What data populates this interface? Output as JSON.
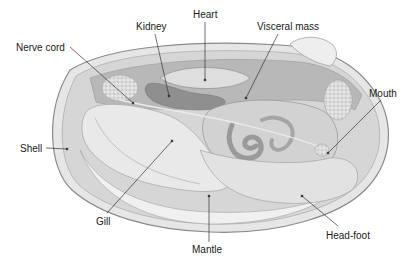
{
  "diagram": {
    "labels": [
      {
        "id": "heart",
        "text": "Heart",
        "x": 193,
        "y": 9
      },
      {
        "id": "kidney",
        "text": "Kidney",
        "x": 136,
        "y": 21
      },
      {
        "id": "visceral-mass",
        "text": "Visceral mass",
        "x": 257,
        "y": 21
      },
      {
        "id": "nerve-cord",
        "text": "Nerve cord",
        "x": 16,
        "y": 42
      },
      {
        "id": "mouth",
        "text": "Mouth",
        "x": 369,
        "y": 88
      },
      {
        "id": "shell",
        "text": "Shell",
        "x": 20,
        "y": 143
      },
      {
        "id": "gill",
        "text": "Gill",
        "x": 96,
        "y": 216
      },
      {
        "id": "mantle",
        "text": "Mantle",
        "x": 192,
        "y": 244
      },
      {
        "id": "head-foot",
        "text": "Head-foot",
        "x": 326,
        "y": 230
      }
    ],
    "colors": {
      "shell_outline": "#8a8a8a",
      "shell_fill": "#e4e4e4",
      "mantle_fill": "#ededed",
      "gill_fill": "#e8e8e8",
      "organ_dark": "#9a9a9a",
      "organ_mid": "#bcbcbc",
      "heart_fill": "#d8d8d8",
      "label_text": "#1a1a1a",
      "leader_line": "#333333"
    }
  }
}
